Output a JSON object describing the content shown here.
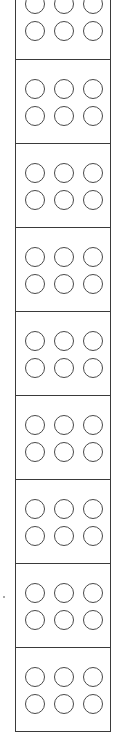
{
  "diagram": {
    "module_count": 9,
    "circle_rows_per_module": 2,
    "circle_cols_per_module": 3,
    "line_color": "#3a3a3a",
    "background_color": "#ffffff",
    "modules": [
      {
        "index": 1,
        "partially_visible": true
      },
      {
        "index": 2,
        "partially_visible": false
      },
      {
        "index": 3,
        "partially_visible": false
      },
      {
        "index": 4,
        "partially_visible": false
      },
      {
        "index": 5,
        "partially_visible": false
      },
      {
        "index": 6,
        "partially_visible": false
      },
      {
        "index": 7,
        "partially_visible": false
      },
      {
        "index": 8,
        "partially_visible": false
      },
      {
        "index": 9,
        "partially_visible": false
      }
    ]
  }
}
